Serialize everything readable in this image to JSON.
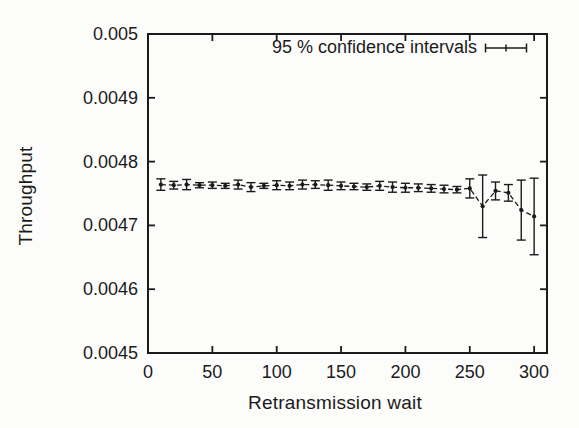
{
  "figure": {
    "background": "#fcfcfb",
    "ink": "#1b1b1b"
  },
  "chart_data": {
    "type": "line",
    "style": "errorbars-with-dashed-line",
    "title": "",
    "xlabel": "Retransmission wait",
    "ylabel": "Throughput",
    "xlim": [
      0,
      310
    ],
    "ylim": [
      0.0045,
      0.005
    ],
    "xticks": [
      0,
      50,
      100,
      150,
      200,
      250,
      300
    ],
    "xtick_labels": [
      "0",
      "50",
      "100",
      "150",
      "200",
      "250",
      "300"
    ],
    "yticks": [
      0.0045,
      0.0046,
      0.0047,
      0.0048,
      0.0049,
      0.005
    ],
    "ytick_labels": [
      "0.0045",
      "0.0046",
      "0.0047",
      "0.0048",
      "0.0049",
      "0.005"
    ],
    "grid": false,
    "legend": {
      "label": "95 % confidence intervals",
      "position": "top-right-inside",
      "key_icon": "errorbar-sample-icon"
    },
    "series": [
      {
        "name": "95 % confidence intervals",
        "x": [
          10,
          20,
          30,
          40,
          50,
          60,
          70,
          80,
          90,
          100,
          110,
          120,
          130,
          140,
          150,
          160,
          170,
          180,
          190,
          200,
          210,
          220,
          230,
          240,
          250,
          260,
          270,
          280,
          290,
          300
        ],
        "y": [
          0.004764,
          0.004763,
          0.004764,
          0.004763,
          0.004763,
          0.004762,
          0.004764,
          0.00476,
          0.004762,
          0.004763,
          0.004762,
          0.004764,
          0.004764,
          0.004763,
          0.004762,
          0.004761,
          0.00476,
          0.004762,
          0.00476,
          0.004759,
          0.004759,
          0.004758,
          0.004757,
          0.004756,
          0.004758,
          0.00473,
          0.004754,
          0.004751,
          0.004724,
          0.004714
        ],
        "yerr": [
          9e-06,
          6e-06,
          8e-06,
          4e-06,
          5e-06,
          4e-06,
          7e-06,
          7e-06,
          4e-06,
          7e-06,
          6e-06,
          7e-06,
          6e-06,
          8e-06,
          6e-06,
          5e-06,
          5e-06,
          7e-06,
          8e-06,
          7e-06,
          6e-06,
          6e-06,
          6e-06,
          5e-06,
          1.5e-05,
          4.9e-05,
          1.4e-05,
          1.3e-05,
          4.7e-05,
          6e-05
        ]
      }
    ]
  }
}
